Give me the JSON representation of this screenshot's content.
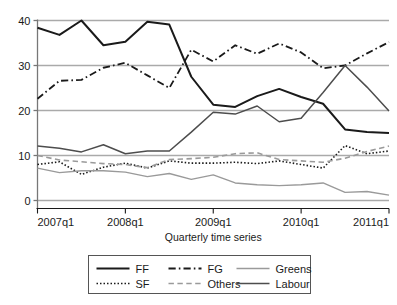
{
  "chart_data": {
    "type": "line",
    "title": "",
    "xlabel": "Quarterly time series",
    "ylabel": "",
    "xlim": [
      0,
      16
    ],
    "ylim": [
      0,
      40
    ],
    "yticks": [
      0,
      10,
      20,
      30,
      40
    ],
    "ytick_labels": [
      "0",
      "10",
      "20",
      "30",
      "40"
    ],
    "xticks": [
      0,
      4,
      8,
      12,
      16
    ],
    "xtick_labels": [
      "2007q1",
      "2008q1",
      "2009q1",
      "2010q1",
      "2011q1"
    ],
    "x": [
      "2007q1",
      "2007q2",
      "2007q3",
      "2007q4",
      "2008q1",
      "2008q2",
      "2008q3",
      "2008q4",
      "2009q1",
      "2009q2",
      "2009q3",
      "2009q4",
      "2010q1",
      "2010q2",
      "2010q3",
      "2010q4",
      "2011q1"
    ],
    "grid": "horizontal",
    "legend_position": "below",
    "legend_columns": 3,
    "series": [
      {
        "name": "FF",
        "style": "solid",
        "color": "#1a1a1a",
        "width": 2.0,
        "values": [
          38.4,
          36.8,
          40.0,
          34.5,
          35.3,
          39.7,
          39.1,
          27.5,
          21.3,
          20.8,
          23.2,
          24.8,
          23.0,
          21.5,
          15.8,
          15.2,
          15.0
        ]
      },
      {
        "name": "FG",
        "style": "dashdot",
        "color": "#1a1a1a",
        "width": 1.8,
        "values": [
          22.6,
          26.6,
          26.8,
          29.5,
          30.6,
          27.8,
          25.0,
          33.5,
          30.9,
          34.5,
          32.6,
          34.9,
          32.9,
          29.4,
          30.0,
          32.7,
          35.2
        ]
      },
      {
        "name": "SF",
        "style": "dotted",
        "color": "#1a1a1a",
        "width": 1.6,
        "values": [
          8.0,
          8.6,
          5.8,
          7.4,
          8.3,
          7.2,
          8.8,
          8.3,
          8.3,
          8.5,
          8.2,
          8.8,
          8.0,
          7.2,
          12.2,
          10.4,
          11.0
        ]
      },
      {
        "name": "Others",
        "style": "dashed",
        "color": "#9a9a9a",
        "width": 1.6,
        "values": [
          10.0,
          9.0,
          8.6,
          8.2,
          8.0,
          7.3,
          9.1,
          9.3,
          9.6,
          10.4,
          10.6,
          9.1,
          8.8,
          8.5,
          9.4,
          10.9,
          12.1
        ]
      },
      {
        "name": "Greens",
        "style": "solid",
        "color": "#9a9a9a",
        "width": 1.4,
        "values": [
          7.2,
          6.2,
          6.6,
          6.6,
          6.3,
          5.3,
          6.0,
          4.7,
          5.7,
          3.9,
          3.5,
          3.3,
          3.5,
          3.9,
          1.8,
          2.0,
          1.2
        ]
      },
      {
        "name": "Labour",
        "style": "solid",
        "color": "#4d4d4d",
        "width": 1.5,
        "values": [
          12.1,
          11.6,
          10.8,
          12.4,
          10.4,
          11.0,
          11.0,
          15.2,
          19.6,
          19.2,
          21.0,
          17.5,
          18.3,
          24.0,
          30.0,
          25.2,
          19.9
        ]
      }
    ]
  },
  "axes": {
    "xlabel": "Quarterly time series"
  },
  "legend": {
    "entries": [
      {
        "label": "FF"
      },
      {
        "label": "FG"
      },
      {
        "label": "Greens"
      },
      {
        "label": "SF"
      },
      {
        "label": "Others"
      },
      {
        "label": "Labour"
      }
    ]
  }
}
